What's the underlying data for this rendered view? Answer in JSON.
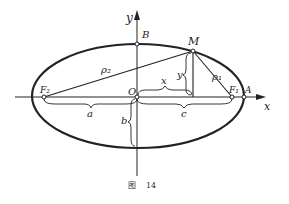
{
  "figure": {
    "caption_prefix": "图",
    "caption_number": "14",
    "axes": {
      "x_label": "x",
      "y_label": "y"
    },
    "points": {
      "F2": "F₂",
      "F1": "F₁",
      "O": "O",
      "A": "A",
      "B": "B",
      "M": "M"
    },
    "segments": {
      "rho2": "ρ₂",
      "rho1": "ρ₁",
      "a": "a",
      "b": "b",
      "c": "c",
      "x": "x",
      "y": "y"
    },
    "colors": {
      "ink": "#222222",
      "background": "#ffffff"
    }
  }
}
